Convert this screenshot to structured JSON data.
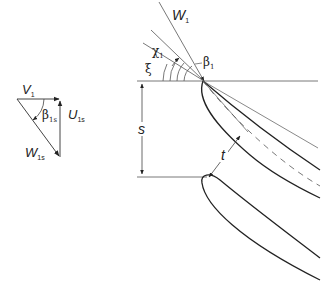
{
  "figure": {
    "type": "cascade-blade-geometry",
    "background": "#ffffff",
    "line_color": "#333333"
  },
  "velocity_triangle": {
    "v1": {
      "symbol": "V",
      "subscript": "1"
    },
    "u1s": {
      "symbol": "U",
      "subscript": "1s"
    },
    "w1s": {
      "symbol": "W",
      "subscript": "1s"
    },
    "beta1s": {
      "symbol": "β",
      "subscript": "1s"
    }
  },
  "cascade": {
    "w1": {
      "symbol": "W",
      "subscript": "1"
    },
    "chi1": {
      "symbol": "χ",
      "subscript": "1"
    },
    "xi": {
      "symbol": "ξ"
    },
    "beta1": {
      "symbol": "β",
      "subscript": "1"
    },
    "pitch": {
      "symbol": "s"
    },
    "throat": {
      "symbol": "t"
    }
  }
}
